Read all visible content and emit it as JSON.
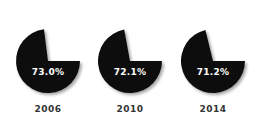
{
  "chart_data": {
    "type": "pie",
    "title": "",
    "categories": [
      "2006",
      "2010",
      "2014"
    ],
    "series": [
      {
        "name": "share",
        "values": [
          73.0,
          72.1,
          71.2
        ]
      }
    ],
    "labels": [
      "73.0%",
      "72.1%",
      "71.2%"
    ],
    "pies": [
      {
        "year": "2006",
        "value": 73.0,
        "label": "73.0%",
        "cx": 48,
        "cy": 61
      },
      {
        "year": "2010",
        "value": 72.1,
        "label": "72.1%",
        "cx": 130,
        "cy": 61
      },
      {
        "year": "2014",
        "value": 71.2,
        "label": "71.2%",
        "cx": 213,
        "cy": 61
      }
    ],
    "radius": 32,
    "slice_color": "#111111",
    "legend": "none",
    "grid": false
  }
}
